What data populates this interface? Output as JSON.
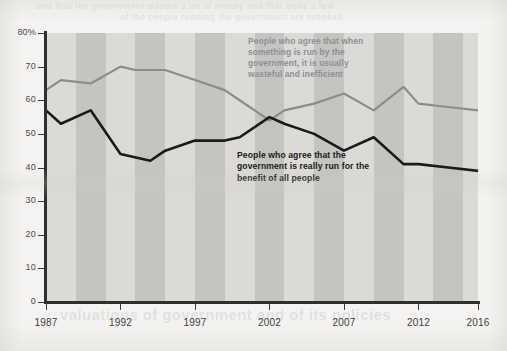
{
  "chart_data": {
    "type": "line",
    "title": "",
    "xlabel": "",
    "ylabel": "",
    "ylim": [
      0,
      80
    ],
    "xlim": [
      1987,
      2016
    ],
    "grid": false,
    "legend_position": "inline-annotations",
    "y_ticks": [
      "0",
      "10",
      "20",
      "30",
      "40",
      "50",
      "60",
      "70",
      "80%"
    ],
    "y_tick_values": [
      0,
      10,
      20,
      30,
      40,
      50,
      60,
      70,
      80
    ],
    "x_ticks": [
      "1987",
      "1992",
      "1997",
      "2002",
      "2007",
      "2012",
      "2016"
    ],
    "x_tick_values": [
      1987,
      1992,
      1997,
      2002,
      2007,
      2012,
      2016
    ],
    "background_bands": "alternating vertical gray stripes, one per 2-year interval",
    "series": [
      {
        "name": "People who agree that when something is run by the government, it is usually wasteful and inefficient",
        "color": "#8b8c8e",
        "x": [
          1987,
          1988,
          1990,
          1992,
          1993,
          1995,
          1997,
          1999,
          2000,
          2002,
          2003,
          2005,
          2007,
          2009,
          2011,
          2012,
          2014,
          2016
        ],
        "values": [
          63,
          66,
          65,
          70,
          69,
          69,
          66,
          63,
          60,
          54,
          57,
          59,
          62,
          57,
          64,
          59,
          58,
          57
        ]
      },
      {
        "name": "People who agree that the government is really run for the benefit of all people",
        "color": "#1a1a1c",
        "x": [
          1987,
          1988,
          1990,
          1992,
          1994,
          1995,
          1997,
          1999,
          2000,
          2002,
          2003,
          2005,
          2007,
          2009,
          2011,
          2012,
          2014,
          2016
        ],
        "values": [
          57,
          53,
          57,
          44,
          42,
          45,
          48,
          48,
          49,
          55,
          53,
          50,
          45,
          49,
          41,
          41,
          40,
          39
        ]
      }
    ]
  },
  "annotations": {
    "gray_label": "People who agree that when something is run by the government, it is usually wasteful and inefficient",
    "dark_label": "People who agree that the government is really run for the benefit of all people"
  },
  "colors": {
    "page_background": "#f4f3f1",
    "band_light": "#dbdad7",
    "band_dark": "#c5c4c1",
    "axis": "#2f2f2f",
    "series_gray": "#8b8c8e",
    "series_dark": "#1a1a1c",
    "tick_label": "#3c3c3c"
  },
  "ghost_text": {
    "top_line_1": "and that the government wastes a lot of money and that quite a few",
    "top_line_2": "of the people running the government are crooked.",
    "middle": "",
    "bottom": "valuations of government and of its policies"
  }
}
